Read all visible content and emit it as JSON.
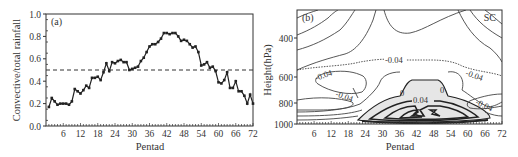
{
  "chart_data": [
    {
      "panel": "(a)",
      "type": "line",
      "xlabel": "Pentad",
      "ylabel": "Convective/total  rainfall",
      "xlim": [
        0,
        72
      ],
      "ylim": [
        0.0,
        1.0
      ],
      "x_ticks": [
        "6",
        "12",
        "18",
        "24",
        "30",
        "36",
        "42",
        "48",
        "54",
        "60",
        "66",
        "72"
      ],
      "y_ticks": [
        "0.0",
        "0.2",
        "0.4",
        "0.6",
        "0.8",
        "1.0"
      ],
      "grid": false,
      "reference_line": {
        "y": 0.5,
        "style": "dashed"
      },
      "series": [
        {
          "name": "Convective/total rainfall ratio",
          "marker": "square",
          "x": [
            1,
            2,
            3,
            4,
            5,
            6,
            7,
            8,
            9,
            10,
            11,
            12,
            13,
            14,
            15,
            16,
            17,
            18,
            19,
            20,
            21,
            22,
            23,
            24,
            25,
            26,
            27,
            28,
            29,
            30,
            31,
            32,
            33,
            34,
            35,
            36,
            37,
            38,
            39,
            40,
            41,
            42,
            43,
            44,
            45,
            46,
            47,
            48,
            49,
            50,
            51,
            52,
            53,
            54,
            55,
            56,
            57,
            58,
            59,
            60,
            61,
            62,
            63,
            64,
            65,
            66,
            67,
            68,
            69,
            70,
            71,
            72
          ],
          "values": [
            0.17,
            0.25,
            0.22,
            0.19,
            0.2,
            0.2,
            0.2,
            0.19,
            0.22,
            0.33,
            0.31,
            0.29,
            0.32,
            0.36,
            0.34,
            0.43,
            0.43,
            0.44,
            0.41,
            0.48,
            0.56,
            0.49,
            0.57,
            0.56,
            0.58,
            0.59,
            0.57,
            0.57,
            0.5,
            0.51,
            0.52,
            0.53,
            0.58,
            0.61,
            0.66,
            0.71,
            0.73,
            0.73,
            0.75,
            0.78,
            0.83,
            0.83,
            0.82,
            0.83,
            0.83,
            0.8,
            0.76,
            0.77,
            0.76,
            0.73,
            0.7,
            0.71,
            0.66,
            0.54,
            0.55,
            0.57,
            0.52,
            0.53,
            0.49,
            0.39,
            0.38,
            0.41,
            0.48,
            0.34,
            0.34,
            0.4,
            0.31,
            0.31,
            0.27,
            0.2,
            0.28,
            0.2
          ]
        }
      ]
    },
    {
      "panel": "(b)",
      "type": "contour",
      "region_label": "SC",
      "xlabel": "Pentad",
      "ylabel": "Height(hPa)",
      "xlim": [
        0,
        72
      ],
      "ylim": [
        1000,
        250
      ],
      "x_ticks": [
        "6",
        "12",
        "18",
        "24",
        "30",
        "36",
        "42",
        "48",
        "54",
        "60",
        "66",
        "72"
      ],
      "y_ticks": [
        "400",
        "600",
        "800",
        "1000"
      ],
      "contour_labels": [
        "-0.04",
        "-0.04",
        "-0.04",
        "-0.04",
        "-0.04",
        "-0.04",
        "0",
        "0",
        "0.04"
      ],
      "shaded_region": "positive values (>0) between pentads ~18 and ~66 below ~680 hPa"
    }
  ],
  "panels": {
    "a": {
      "label": "(a)",
      "xlabel": "Pentad",
      "ylabel": "Convective/total  rainfall",
      "x_ticks": [
        "6",
        "12",
        "18",
        "24",
        "30",
        "36",
        "42",
        "48",
        "54",
        "60",
        "66",
        "72"
      ],
      "y_ticks": [
        "0.0",
        "0.2",
        "0.4",
        "0.6",
        "0.8",
        "1.0"
      ]
    },
    "b": {
      "label": "(b)",
      "region": "SC",
      "xlabel": "Pentad",
      "ylabel": "Height(hPa)",
      "x_ticks": [
        "6",
        "12",
        "18",
        "24",
        "30",
        "36",
        "42",
        "48",
        "54",
        "60",
        "66",
        "72"
      ],
      "y_ticks": [
        "400",
        "600",
        "800",
        "1000"
      ],
      "contour_labels": {
        "neg_mid": "-0.04",
        "neg_left_upper": "-0.04",
        "neg_left_lower": "-0.04",
        "neg_right_upper": "-0.04",
        "neg_right_lower": "-0.04",
        "zero_left": "0",
        "zero_right": "0",
        "pos": "0.04"
      }
    }
  }
}
